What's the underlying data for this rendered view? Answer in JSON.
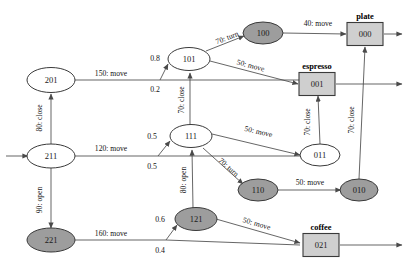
{
  "diagram": {
    "colors": {
      "shaded_node": "#9d9d9d",
      "plain_node": "#ffffff",
      "goal_box": "#cfcfcf",
      "edge": "#4a4a4a",
      "text": "#121212"
    },
    "nodes": [
      {
        "id": "201",
        "label": "201",
        "shape": "ellipse",
        "shaded": false,
        "x": 51,
        "y": 80
      },
      {
        "id": "211",
        "label": "211",
        "shape": "ellipse",
        "shaded": false,
        "x": 51,
        "y": 156
      },
      {
        "id": "221",
        "label": "221",
        "shape": "ellipse",
        "shaded": true,
        "x": 51,
        "y": 240
      },
      {
        "id": "101",
        "label": "101",
        "shape": "ellipse",
        "shaded": false,
        "x": 189,
        "y": 59
      },
      {
        "id": "111",
        "label": "111",
        "shape": "ellipse",
        "shaded": false,
        "x": 191,
        "y": 136
      },
      {
        "id": "121",
        "label": "121",
        "shape": "ellipse",
        "shaded": true,
        "x": 196,
        "y": 219
      },
      {
        "id": "100",
        "label": "100",
        "shape": "ellipse",
        "shaded": true,
        "x": 263,
        "y": 33
      },
      {
        "id": "110",
        "label": "110",
        "shape": "ellipse",
        "shaded": true,
        "x": 258,
        "y": 190
      },
      {
        "id": "011",
        "label": "011",
        "shape": "ellipse",
        "shaded": false,
        "x": 320,
        "y": 155
      },
      {
        "id": "010",
        "label": "010",
        "shape": "ellipse",
        "shaded": true,
        "x": 359,
        "y": 190
      },
      {
        "id": "000",
        "label": "000",
        "shape": "box",
        "shaded": false,
        "x": 365,
        "y": 34,
        "goal": "plate"
      },
      {
        "id": "001",
        "label": "001",
        "shape": "box",
        "shaded": false,
        "x": 317,
        "y": 84,
        "goal": "espresso"
      },
      {
        "id": "021",
        "label": "021",
        "shape": "box",
        "shaded": false,
        "x": 321,
        "y": 245,
        "goal": "coffee"
      }
    ],
    "goal_labels": [
      {
        "for": "000",
        "text": "plate",
        "x": 365,
        "y": 19
      },
      {
        "for": "001",
        "text": "espresso",
        "x": 317,
        "y": 69
      },
      {
        "for": "021",
        "text": "coffee",
        "x": 321,
        "y": 230
      }
    ],
    "edge_labels": [
      {
        "id": "e201-split",
        "text": "150: move",
        "x": 111,
        "y": 76
      },
      {
        "id": "e211-split",
        "text": "120: move",
        "x": 111,
        "y": 151
      },
      {
        "id": "e221-split",
        "text": "160: move",
        "x": 111,
        "y": 236
      },
      {
        "id": "e201-211",
        "text": "80: close",
        "x": 42,
        "y": 118,
        "vertical": true
      },
      {
        "id": "e211-221",
        "text": "90: open",
        "x": 42,
        "y": 200,
        "vertical": true
      },
      {
        "id": "e111-101",
        "text": "70: close",
        "x": 184,
        "y": 100,
        "vertical": true
      },
      {
        "id": "e121-111",
        "text": "80: open",
        "x": 188,
        "y": 180,
        "vertical": true
      },
      {
        "id": "e011-001",
        "text": "70: close",
        "x": 310,
        "y": 122,
        "vertical": true
      },
      {
        "id": "e010-000",
        "text": "70: close",
        "x": 352,
        "y": 120,
        "vertical": true
      },
      {
        "id": "e101-100",
        "text": "70: turn",
        "x": 228,
        "y": 40,
        "rotated": true
      },
      {
        "id": "e111-110",
        "text": "70: turn",
        "x": 227,
        "y": 169,
        "rotated": true
      },
      {
        "id": "e100-000",
        "text": "40: move",
        "x": 318,
        "y": 26
      },
      {
        "id": "e101-001",
        "text": "50: move",
        "x": 248,
        "y": 70
      },
      {
        "id": "e111-011",
        "text": "50: move",
        "x": 258,
        "y": 134
      },
      {
        "id": "e110-010",
        "text": "50: move",
        "x": 310,
        "y": 185
      },
      {
        "id": "e121-021",
        "text": "50: move",
        "x": 256,
        "y": 226
      }
    ],
    "probabilities": [
      {
        "id": "p201-101",
        "value": "0.8",
        "x": 155,
        "y": 61
      },
      {
        "id": "p201-111",
        "value": "0.2",
        "x": 155,
        "y": 89
      },
      {
        "id": "p211-111",
        "value": "0.5",
        "x": 152,
        "y": 139
      },
      {
        "id": "p211-121",
        "value": "0.5",
        "x": 152,
        "y": 166
      },
      {
        "id": "p221-121",
        "value": "0.6",
        "x": 160,
        "y": 222
      },
      {
        "id": "p221-021",
        "value": "0.4",
        "x": 160,
        "y": 249
      }
    ]
  }
}
